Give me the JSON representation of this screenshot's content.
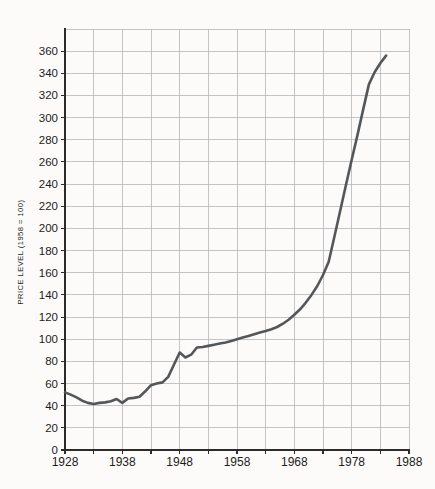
{
  "page": {
    "background": "#fcfbf9"
  },
  "colors": {
    "line": "#54575a",
    "grid": "#b4b7ba",
    "axis": "#2b2b2b",
    "text": "#1c1c1c",
    "background": "#fcfbf9"
  },
  "chart_data": {
    "type": "line",
    "title": "",
    "xlabel": "",
    "ylabel": "PRICE LEVEL (1958 = 100)",
    "xlim": [
      1928,
      1988
    ],
    "ylim": [
      0,
      380
    ],
    "grid": true,
    "legend": "none",
    "x_grid_step": 5,
    "y_grid_step": 20,
    "x_ticks": [
      1928,
      1938,
      1948,
      1958,
      1968,
      1978,
      1988
    ],
    "y_ticks": [
      0,
      20,
      40,
      60,
      80,
      100,
      120,
      140,
      160,
      180,
      200,
      220,
      240,
      260,
      280,
      300,
      320,
      340,
      360
    ],
    "series": [
      {
        "name": "price-level",
        "x": [
          1928,
          1929,
          1930,
          1931,
          1932,
          1933,
          1934,
          1935,
          1936,
          1937,
          1938,
          1939,
          1940,
          1941,
          1942,
          1943,
          1944,
          1945,
          1946,
          1947,
          1948,
          1949,
          1950,
          1951,
          1952,
          1953,
          1954,
          1955,
          1956,
          1957,
          1958,
          1959,
          1960,
          1961,
          1962,
          1963,
          1964,
          1965,
          1966,
          1967,
          1968,
          1969,
          1970,
          1971,
          1972,
          1973,
          1974,
          1975,
          1976,
          1977,
          1978,
          1979,
          1980,
          1981,
          1982,
          1983,
          1984
        ],
        "y": [
          52,
          50,
          47.5,
          44.5,
          42.5,
          41.5,
          42.5,
          43,
          44,
          46,
          42.5,
          46.5,
          47,
          48,
          53,
          58.5,
          60,
          61,
          66,
          77,
          88,
          83.5,
          86,
          92.5,
          93,
          94,
          95,
          96,
          97,
          98.5,
          100,
          101.5,
          103,
          104.5,
          106,
          107.5,
          109,
          111,
          114,
          117.5,
          122,
          127,
          133,
          140,
          148,
          158,
          170,
          193,
          216,
          239,
          262,
          284,
          307,
          330,
          341,
          349,
          356
        ]
      }
    ]
  }
}
